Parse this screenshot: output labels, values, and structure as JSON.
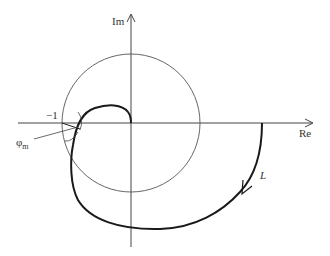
{
  "diagram": {
    "type": "nyquist-plot",
    "axes": {
      "real_label": "Re",
      "imag_label": "Im"
    },
    "critical_point_label": "−1",
    "phase_margin_label": "φ",
    "phase_margin_subscript": "m",
    "curve_label": "L",
    "unit_circle": true,
    "colors": {
      "curve": "#1a1a1a",
      "axes": "#444444",
      "circle": "#555555"
    }
  }
}
